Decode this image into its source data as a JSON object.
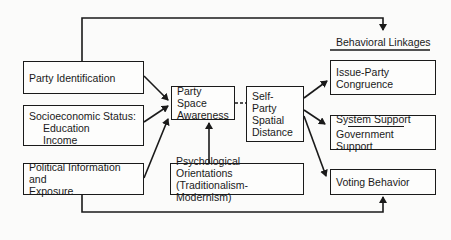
{
  "diagram": {
    "header": {
      "behavioral_linkages": "Behavioral Linkages"
    },
    "inputs": {
      "party_identification": "Party Identification",
      "socioeconomic_status": {
        "title": "Socioeconomic Status:",
        "items": [
          "Education",
          "Income"
        ]
      },
      "political_information": {
        "line1": "Political Information and",
        "line2": "Exposure"
      }
    },
    "mediators": {
      "party_space_awareness": {
        "line1": "Party Space",
        "line2": "Awareness"
      },
      "self_party_spatial_distance": {
        "line1": "Self-Party",
        "line2": "Spatial",
        "line3": "Distance"
      },
      "psychological_orientations": {
        "line1": "Psychological Orientations",
        "line2": "(Traditionalism-Modernism)"
      }
    },
    "outcomes": {
      "issue_party_congruence": {
        "line1": "Issue-Party",
        "line2": "Congruence"
      },
      "support": {
        "line1": "System Support",
        "line2": "Government Support"
      },
      "voting_behavior": "Voting Behavior"
    },
    "edges": [
      {
        "from": "Party Identification",
        "to": "Party Space Awareness",
        "style": "solid-arrow"
      },
      {
        "from": "Socioeconomic Status",
        "to": "Party Space Awareness",
        "style": "solid-arrow"
      },
      {
        "from": "Political Information and Exposure",
        "to": "Party Space Awareness",
        "style": "solid-arrow"
      },
      {
        "from": "Psychological Orientations",
        "to": "Party Space Awareness",
        "style": "solid-arrow"
      },
      {
        "from": "Party Space Awareness",
        "to": "Self-Party Spatial Distance",
        "style": "dashed"
      },
      {
        "from": "Self-Party Spatial Distance",
        "to": "Issue-Party Congruence",
        "style": "solid-arrow"
      },
      {
        "from": "Self-Party Spatial Distance",
        "to": "System Support / Government Support",
        "style": "solid-arrow"
      },
      {
        "from": "Self-Party Spatial Distance",
        "to": "Voting Behavior",
        "style": "solid-arrow"
      },
      {
        "from": "Party Identification",
        "to": "Behavioral Linkages",
        "style": "solid-arrow"
      },
      {
        "from": "Political Information and Exposure",
        "to": "Voting Behavior",
        "style": "solid-arrow"
      }
    ],
    "colors": {
      "ink": "#1a1a1a",
      "paper": "#fbfbfa"
    }
  }
}
